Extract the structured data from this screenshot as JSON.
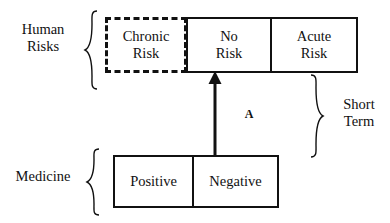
{
  "diagram": {
    "groups": {
      "human_risks": "Human\nRisks",
      "medicine": "Medicine",
      "short_term": "Short\nTerm"
    },
    "risk_boxes": [
      {
        "label": "Chronic\nRisk",
        "style": "dashed"
      },
      {
        "label": "No\nRisk",
        "style": "solid"
      },
      {
        "label": "Acute\nRisk",
        "style": "solid"
      }
    ],
    "medicine_boxes": [
      {
        "label": "Positive",
        "style": "solid"
      },
      {
        "label": "Negative",
        "style": "solid"
      }
    ],
    "arrow": {
      "label": "A",
      "from": "Negative",
      "to": "No Risk",
      "direction": "up"
    },
    "colors": {
      "stroke": "#111111",
      "background": "#ffffff"
    }
  }
}
